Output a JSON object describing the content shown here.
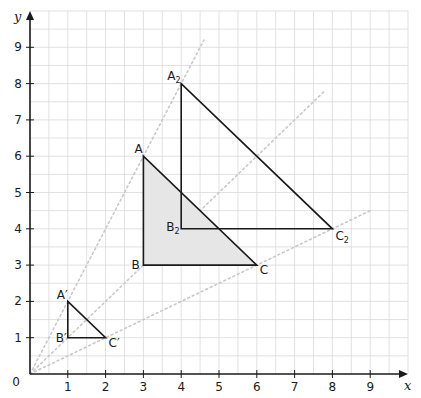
{
  "chart_data": {
    "type": "diagram",
    "title": "",
    "xlabel": "x",
    "ylabel": "y",
    "xlim": [
      0,
      10
    ],
    "ylim": [
      0,
      10
    ],
    "grid": {
      "on": true,
      "minor_step": 0.5,
      "color": "#d9d9d9"
    },
    "x_ticks": [
      1,
      2,
      3,
      4,
      5,
      6,
      7,
      8,
      9
    ],
    "y_ticks": [
      1,
      2,
      3,
      4,
      5,
      6,
      7,
      8,
      9
    ],
    "origin_label": "0",
    "shapes": [
      {
        "name": "Triangle ABC",
        "filled": true,
        "fill": "#e6e6e6",
        "vertices": [
          {
            "label": "A",
            "x": 3,
            "y": 6
          },
          {
            "label": "B",
            "x": 3,
            "y": 3
          },
          {
            "label": "C",
            "x": 6,
            "y": 3
          }
        ]
      },
      {
        "name": "Triangle A'B'C'",
        "filled": false,
        "vertices": [
          {
            "label": "A′",
            "x": 1,
            "y": 2
          },
          {
            "label": "B′",
            "x": 1,
            "y": 1
          },
          {
            "label": "C′",
            "x": 2,
            "y": 1
          }
        ]
      },
      {
        "name": "Triangle A2B2C2",
        "filled": false,
        "vertices": [
          {
            "label": "A2",
            "x": 4,
            "y": 8
          },
          {
            "label": "B2",
            "x": 4,
            "y": 4
          },
          {
            "label": "C2",
            "x": 8,
            "y": 4
          }
        ]
      }
    ],
    "construction_lines": [
      {
        "style": "dotted",
        "from": [
          0,
          0
        ],
        "to": [
          4.6,
          9.2
        ],
        "through": "A′, A2"
      },
      {
        "style": "dotted",
        "from": [
          0,
          0
        ],
        "to": [
          7.8,
          7.8
        ],
        "through": "B′, B2"
      },
      {
        "style": "dotted",
        "from": [
          0,
          0
        ],
        "to": [
          9.0,
          4.5
        ],
        "through": "C′, C2"
      }
    ]
  },
  "labels": {
    "x_axis": "x",
    "y_axis": "y",
    "origin": "0",
    "A": "A",
    "B": "B",
    "C": "C",
    "A1": "A′",
    "B1": "B′",
    "C1": "C′",
    "A2": "A",
    "B2": "B",
    "C2": "C",
    "sub2": "2"
  }
}
